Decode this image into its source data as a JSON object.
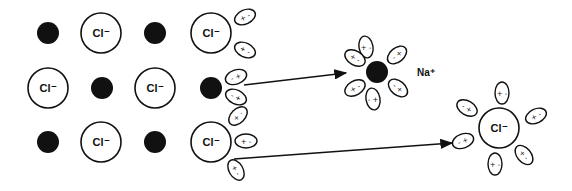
{
  "diagram": {
    "title": "",
    "colors": {
      "ink": "#111111",
      "background": "#ffffff"
    },
    "lattice": {
      "cation_label": "",
      "anion_label": "Cl⁻",
      "rows": [
        [
          "Na",
          "Cl",
          "Na",
          "Cl"
        ],
        [
          "Cl",
          "Na",
          "Cl",
          "Na"
        ],
        [
          "Na",
          "Cl",
          "Na",
          "Cl"
        ]
      ]
    },
    "water_molecules": {
      "glyph_a": "+ -",
      "glyph_b": "- +"
    },
    "hydrated_cation": {
      "label": "Na⁺"
    },
    "hydrated_anion": {
      "label": "Cl⁻"
    },
    "arrows": [
      {
        "from": "lattice-Na-edge",
        "to": "hydrated-Na"
      },
      {
        "from": "lattice-Cl-edge",
        "to": "hydrated-Cl"
      }
    ]
  }
}
